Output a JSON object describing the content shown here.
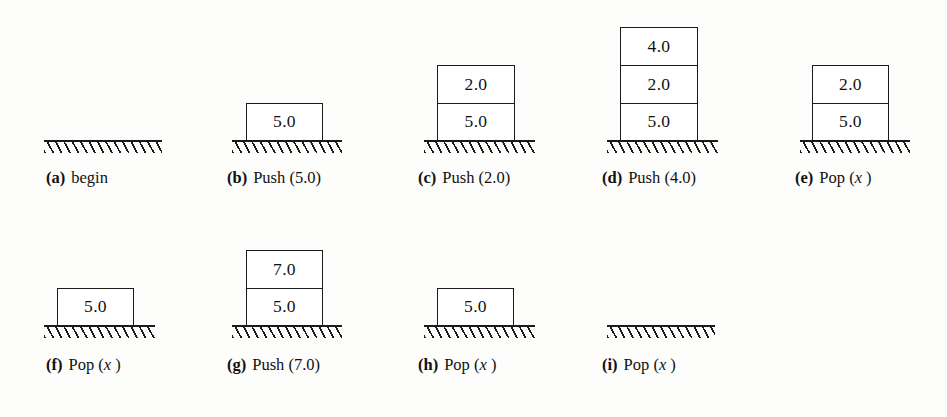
{
  "figure": {
    "box_width": 77,
    "box_height": 38,
    "ground_color": "#1a1a1a",
    "box_fill": "#ffffff"
  },
  "panels": [
    {
      "id": "a",
      "tag": "(a)",
      "operation": "begin",
      "caption": "(a)  begin",
      "stack": [],
      "ground": {
        "x": 44,
        "width": 118,
        "y": 140
      },
      "box": {
        "x": 0,
        "width": 77
      },
      "caption_pos": {
        "x": 46,
        "y": 170
      }
    },
    {
      "id": "b",
      "tag": "(b)",
      "operation": "Push (5.0)",
      "caption": "(b)  Push (5.0)",
      "stack": [
        "5.0"
      ],
      "ground": {
        "x": 232,
        "width": 110,
        "y": 140
      },
      "box": {
        "x": 246,
        "width": 77
      },
      "caption_pos": {
        "x": 227,
        "y": 170
      }
    },
    {
      "id": "c",
      "tag": "(c)",
      "operation": "Push (2.0)",
      "caption": "(c)  Push (2.0)",
      "stack": [
        "2.0",
        "5.0"
      ],
      "ground": {
        "x": 424,
        "width": 111,
        "y": 140
      },
      "box": {
        "x": 437,
        "width": 78
      },
      "caption_pos": {
        "x": 418,
        "y": 170
      }
    },
    {
      "id": "d",
      "tag": "(d)",
      "operation": "Push (4.0)",
      "caption": "(d)  Push (4.0)",
      "stack": [
        "4.0",
        "2.0",
        "5.0"
      ],
      "ground": {
        "x": 607,
        "width": 111,
        "y": 140
      },
      "box": {
        "x": 620,
        "width": 78
      },
      "caption_pos": {
        "x": 602,
        "y": 170
      }
    },
    {
      "id": "e",
      "tag": "(e)",
      "operation": "Pop (x)",
      "caption": "(e)  Pop (x)",
      "stack": [
        "2.0",
        "5.0"
      ],
      "ground": {
        "x": 800,
        "width": 110,
        "y": 140
      },
      "box": {
        "x": 812,
        "width": 77
      },
      "caption_pos": {
        "x": 795,
        "y": 170
      }
    },
    {
      "id": "f",
      "tag": "(f)",
      "operation": "Pop (x)",
      "caption": "(f)  Pop (x)",
      "stack": [
        "5.0"
      ],
      "ground": {
        "x": 44,
        "width": 111,
        "y": 325
      },
      "box": {
        "x": 57,
        "width": 77
      },
      "caption_pos": {
        "x": 46,
        "y": 357
      }
    },
    {
      "id": "g",
      "tag": "(g)",
      "operation": "Push (7.0)",
      "caption": "(g)  Push (7.0)",
      "stack": [
        "7.0",
        "5.0"
      ],
      "ground": {
        "x": 232,
        "width": 110,
        "y": 325
      },
      "box": {
        "x": 246,
        "width": 77
      },
      "caption_pos": {
        "x": 227,
        "y": 357
      }
    },
    {
      "id": "h",
      "tag": "(h)",
      "operation": "Pop (x)",
      "caption": "(h)  Pop (x)",
      "stack": [
        "5.0"
      ],
      "ground": {
        "x": 424,
        "width": 111,
        "y": 325
      },
      "box": {
        "x": 437,
        "width": 77
      },
      "caption_pos": {
        "x": 418,
        "y": 357
      }
    },
    {
      "id": "i",
      "tag": "(i)",
      "operation": "Pop (x)",
      "caption": "(i)  Pop (x)",
      "stack": [],
      "ground": {
        "x": 607,
        "width": 108,
        "y": 325
      },
      "box": {
        "x": 620,
        "width": 77
      },
      "caption_pos": {
        "x": 602,
        "y": 357
      }
    }
  ]
}
